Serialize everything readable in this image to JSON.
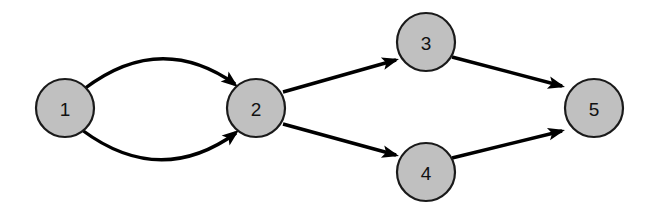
{
  "diagram": {
    "type": "directed-graph",
    "background_color": "#ffffff",
    "node_fill_color": "#c0c0c0",
    "node_stroke_color": "#1a1a1a",
    "edge_color": "#000000",
    "label_color": "#111111",
    "node_radius": 29,
    "node_stroke_width": 2.2,
    "edge_stroke_width": 3.4,
    "nodes": [
      {
        "id": "1",
        "label": "1",
        "cx": 65,
        "cy": 108,
        "r": 29
      },
      {
        "id": "2",
        "label": "2",
        "cx": 256,
        "cy": 108,
        "r": 29
      },
      {
        "id": "3",
        "label": "3",
        "cx": 426,
        "cy": 42,
        "r": 29
      },
      {
        "id": "4",
        "label": "4",
        "cx": 426,
        "cy": 172,
        "r": 29
      },
      {
        "id": "5",
        "label": "5",
        "cx": 594,
        "cy": 108,
        "r": 29
      }
    ],
    "edges": [
      {
        "id": "e1-2-upper",
        "from": "1",
        "to": "2",
        "shape": "curved-upper",
        "path": "M 84 89 Q 160 31 235 84",
        "arrow": true,
        "arrow_tip_x": 238,
        "arrow_tip_y": 87,
        "arrow_angle_deg": 38
      },
      {
        "id": "e1-2-lower",
        "from": "1",
        "to": "2",
        "shape": "curved-lower",
        "path": "M 82 130 Q 160 188 236 133",
        "arrow": true,
        "arrow_tip_x": 239,
        "arrow_tip_y": 130,
        "arrow_angle_deg": -38
      },
      {
        "id": "e2-3",
        "from": "2",
        "to": "3",
        "shape": "straight",
        "path": "M 283 92 L 396 60",
        "arrow": true,
        "arrow_tip_x": 399,
        "arrow_tip_y": 59,
        "arrow_angle_deg": -16
      },
      {
        "id": "e2-4",
        "from": "2",
        "to": "4",
        "shape": "straight",
        "path": "M 283 124 L 396 155",
        "arrow": true,
        "arrow_tip_x": 399,
        "arrow_tip_y": 156,
        "arrow_angle_deg": 15
      },
      {
        "id": "e3-5",
        "from": "3",
        "to": "5",
        "shape": "straight",
        "path": "M 452 57 L 562 86",
        "arrow": true,
        "arrow_tip_x": 565,
        "arrow_tip_y": 87,
        "arrow_angle_deg": 15
      },
      {
        "id": "e4-5",
        "from": "4",
        "to": "5",
        "shape": "straight",
        "path": "M 452 158 L 562 131",
        "arrow": true,
        "arrow_tip_x": 565,
        "arrow_tip_y": 130,
        "arrow_angle_deg": -14
      }
    ]
  }
}
